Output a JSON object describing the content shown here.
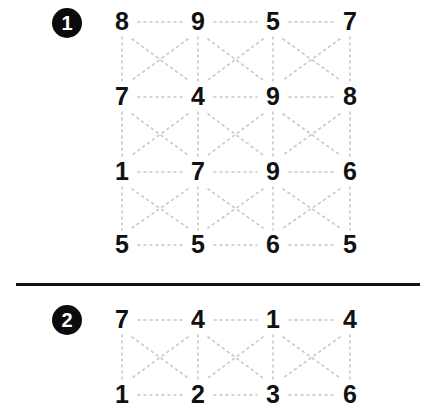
{
  "page": {
    "background_color": "#ffffff",
    "ink_color": "#111111",
    "dotted_guide_color": "#c8c8c8",
    "divider_color": "#121212"
  },
  "divider": {
    "name": "section-divider"
  },
  "puzzles": [
    {
      "marker": "1",
      "marker_name": "puzzle-marker-1",
      "columns": 4,
      "rows": 4,
      "values": [
        [
          "8",
          "9",
          "5",
          "7"
        ],
        [
          "7",
          "4",
          "9",
          "8"
        ],
        [
          "1",
          "7",
          "9",
          "6"
        ],
        [
          "5",
          "5",
          "6",
          "5"
        ]
      ]
    },
    {
      "marker": "2",
      "marker_name": "puzzle-marker-2",
      "columns": 4,
      "rows": 2,
      "values": [
        [
          "7",
          "4",
          "1",
          "4"
        ],
        [
          "1",
          "2",
          "3",
          "6"
        ]
      ]
    }
  ]
}
